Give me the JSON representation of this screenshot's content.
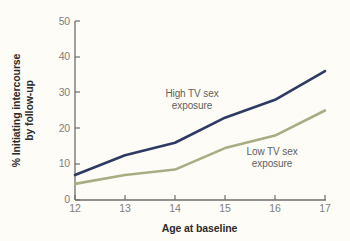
{
  "chart_data": {
    "type": "line",
    "title": "",
    "xlabel": "Age at baseline",
    "ylabel": "% Initiating intercourse by follow-up",
    "ylabel_line1": "% Initiating intercourse",
    "ylabel_line2": "by follow-up",
    "x": [
      12,
      13,
      14,
      15,
      16,
      17
    ],
    "xticklabels": [
      "12",
      "13",
      "14",
      "15",
      "16",
      "17"
    ],
    "yticklabels": [
      "0",
      "10",
      "20",
      "30",
      "40",
      "50"
    ],
    "yticks": [
      0,
      10,
      20,
      30,
      40,
      50
    ],
    "xlim": [
      12,
      17
    ],
    "ylim": [
      0,
      50
    ],
    "grid": false,
    "legend_position": "inline-annotations",
    "series": [
      {
        "name": "High TV sex exposure",
        "color": "#2d3a63",
        "values": [
          7,
          12.5,
          16,
          23,
          28,
          36
        ],
        "annotation_line1": "High TV sex",
        "annotation_line2": "exposure"
      },
      {
        "name": "Low TV sex exposure",
        "color": "#a8ad84",
        "values": [
          4.5,
          7,
          8.5,
          14.5,
          18,
          25
        ],
        "annotation_line1": "Low TV sex",
        "annotation_line2": "exposure"
      }
    ],
    "background_color": "#fdfcf7",
    "axis_color": "#6e6e6e",
    "tick_label_color": "#7e7e7e",
    "axis_title_color": "#2b2b2b"
  }
}
